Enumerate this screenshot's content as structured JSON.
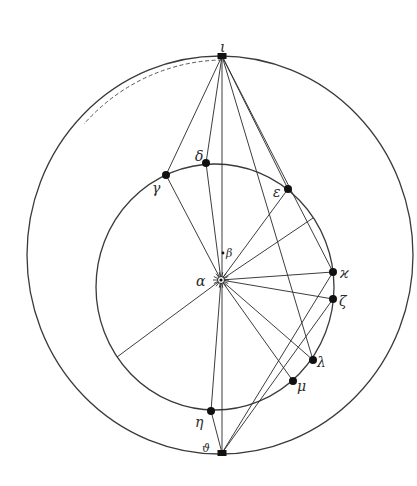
{
  "figure": {
    "type": "geometric-construction",
    "stroke_color": "#333333",
    "dot_color": "#111111"
  },
  "circles": {
    "outer": {
      "cx": 220,
      "cy": 255,
      "rx": 193,
      "ry": 199
    },
    "inner": {
      "cx": 215,
      "cy": 287,
      "rx": 119,
      "ry": 123
    }
  },
  "dashed_arc": {
    "from": [
      222,
      60
    ],
    "to": [
      84,
      124
    ],
    "rx": 190,
    "ry": 196
  },
  "labels": {
    "iota": "ι",
    "delta": "δ",
    "gamma": "γ",
    "epsilon": "ε",
    "beta": "β",
    "alpha": "α",
    "kappa": "ϰ",
    "zeta": "ζ",
    "lambda": "λ",
    "mu": "μ",
    "eta": "η",
    "theta": "ϑ"
  },
  "points": {
    "iota": {
      "x": 222,
      "y": 56,
      "marker": "block"
    },
    "gamma": {
      "x": 166,
      "y": 175,
      "marker": "dot"
    },
    "delta": {
      "x": 206,
      "y": 163,
      "marker": "dot"
    },
    "epsilon": {
      "x": 288,
      "y": 189,
      "marker": "dot"
    },
    "kappa": {
      "x": 333,
      "y": 272,
      "marker": "dot"
    },
    "zeta": {
      "x": 333,
      "y": 299,
      "marker": "dot"
    },
    "lambda": {
      "x": 313,
      "y": 360,
      "marker": "dot"
    },
    "mu": {
      "x": 293,
      "y": 381,
      "marker": "dot"
    },
    "eta": {
      "x": 211,
      "y": 411,
      "marker": "dot"
    },
    "theta": {
      "x": 222,
      "y": 453,
      "marker": "block"
    },
    "alpha": {
      "x": 221,
      "y": 280,
      "marker": "sun"
    },
    "beta": {
      "x": 223,
      "y": 253,
      "marker": "small"
    },
    "p1": {
      "x": 313,
      "y": 218,
      "marker": "none"
    },
    "p2": {
      "x": 117,
      "y": 357,
      "marker": "none"
    }
  },
  "lines": [
    [
      "iota",
      "gamma"
    ],
    [
      "iota",
      "delta"
    ],
    [
      "iota",
      "theta"
    ],
    [
      "iota",
      "epsilon"
    ],
    [
      "iota",
      "kappa"
    ],
    [
      "iota",
      "lambda"
    ],
    [
      "alpha",
      "gamma"
    ],
    [
      "alpha",
      "delta"
    ],
    [
      "alpha",
      "epsilon"
    ],
    [
      "alpha",
      "p1"
    ],
    [
      "alpha",
      "kappa"
    ],
    [
      "alpha",
      "zeta"
    ],
    [
      "alpha",
      "lambda"
    ],
    [
      "alpha",
      "mu"
    ],
    [
      "alpha",
      "eta"
    ],
    [
      "alpha",
      "p2"
    ],
    [
      "theta",
      "eta"
    ],
    [
      "theta",
      "kappa"
    ],
    [
      "theta",
      "zeta"
    ]
  ],
  "sun_symbol": {
    "rays": 14,
    "inner_r": 3.5,
    "outer_r": 8
  }
}
